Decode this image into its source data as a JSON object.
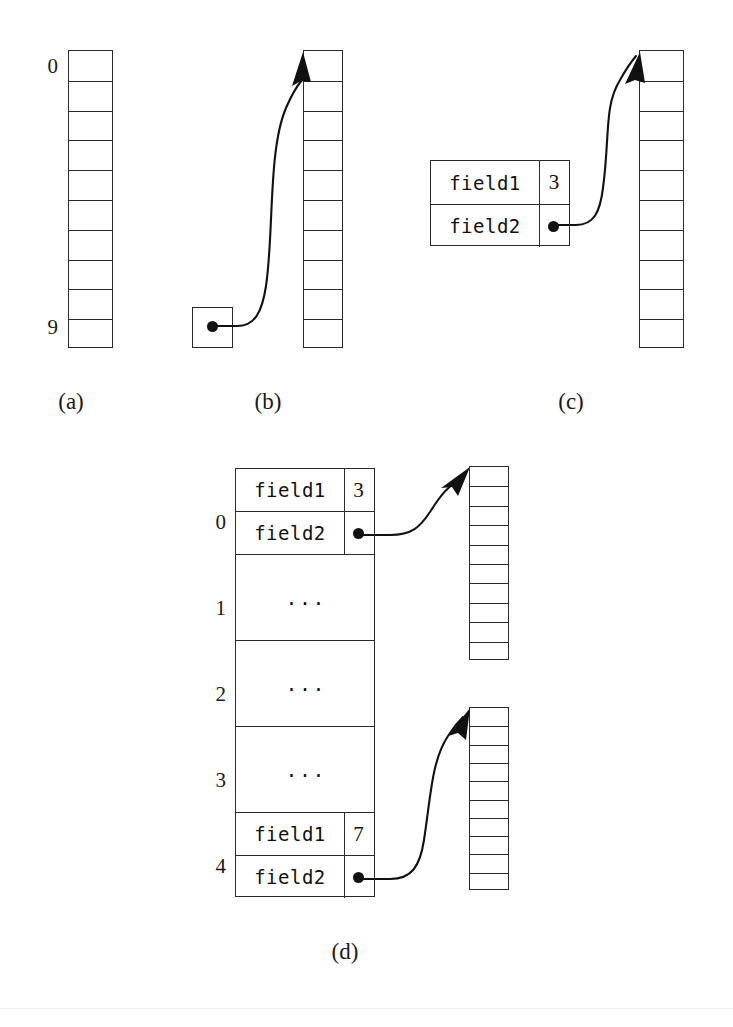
{
  "figure": {
    "captions": [
      {
        "id": "a",
        "label": "(a)"
      },
      {
        "id": "b",
        "label": "(b)"
      },
      {
        "id": "c",
        "label": "(c)"
      },
      {
        "id": "d",
        "label": "(d)"
      }
    ]
  },
  "panel_a": {
    "caption": "(a)",
    "array": {
      "cells": 10,
      "index_top": "0",
      "index_bottom": "9",
      "cell_values": [
        "",
        "",
        "",
        "",
        "",
        "",
        "",
        "",
        "",
        ""
      ]
    }
  },
  "panel_b": {
    "caption": "(b)",
    "pointer_box": {
      "value": "",
      "marker": "dot"
    },
    "array": {
      "cells": 10,
      "cell_values": [
        "",
        "",
        "",
        "",
        "",
        "",
        "",
        "",
        "",
        ""
      ]
    },
    "arrow": {
      "from": "pointer-dot",
      "to": "array-top"
    }
  },
  "panel_c": {
    "caption": "(c)",
    "record": {
      "rows": [
        {
          "name": "field1",
          "value": "3",
          "kind": "number"
        },
        {
          "name": "field2",
          "value": "",
          "kind": "pointer"
        }
      ]
    },
    "array": {
      "cells": 10,
      "cell_values": [
        "",
        "",
        "",
        "",
        "",
        "",
        "",
        "",
        "",
        ""
      ]
    },
    "arrow": {
      "from": "field2-dot",
      "to": "array-top"
    }
  },
  "panel_d": {
    "caption": "(d)",
    "array_of_structs": {
      "slots": [
        {
          "index": "0",
          "type": "record",
          "rows": [
            {
              "name": "field1",
              "value": "3",
              "kind": "number"
            },
            {
              "name": "field2",
              "value": "",
              "kind": "pointer"
            }
          ]
        },
        {
          "index": "1",
          "type": "ellipsis",
          "text": "..."
        },
        {
          "index": "2",
          "type": "ellipsis",
          "text": "..."
        },
        {
          "index": "3",
          "type": "ellipsis",
          "text": "..."
        },
        {
          "index": "4",
          "type": "record",
          "rows": [
            {
              "name": "field1",
              "value": "7",
              "kind": "number"
            },
            {
              "name": "field2",
              "value": "",
              "kind": "pointer"
            }
          ]
        }
      ]
    },
    "target_arrays": [
      {
        "id": "top",
        "cells": 10,
        "cell_values": [
          "",
          "",
          "",
          "",
          "",
          "",
          "",
          "",
          "",
          ""
        ]
      },
      {
        "id": "bottom",
        "cells": 10,
        "cell_values": [
          "",
          "",
          "",
          "",
          "",
          "",
          "",
          "",
          "",
          ""
        ]
      }
    ],
    "arrows": [
      {
        "from": "slot0-field2-dot",
        "to": "top-array-top"
      },
      {
        "from": "slot4-field2-dot",
        "to": "bottom-array-top"
      }
    ]
  },
  "style": {
    "ink": "#1a1a1a",
    "line": "#2b2b2b",
    "background": "#ffffff"
  }
}
